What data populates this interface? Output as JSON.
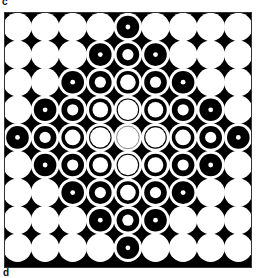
{
  "panel_labels": {
    "top": "c",
    "bottom": "d"
  },
  "figure": {
    "grid_rows": 9,
    "grid_cols": 9,
    "center_cell": [
      4,
      4
    ],
    "colors": {
      "background": "#000000",
      "disk": "#ffffff",
      "ring": "#000000",
      "frame": "#333333",
      "center_line": "#777777"
    },
    "ring_levels": [
      {
        "distance": 0,
        "style": "plain-with-faint-outline"
      },
      {
        "distance": 1,
        "style": "thin-ring-large-center"
      },
      {
        "distance": 2,
        "style": "ring-medium-center"
      },
      {
        "distance": 3,
        "style": "thick-ring-small-center"
      },
      {
        "distance": 4,
        "style": "bullseye-dot"
      }
    ]
  }
}
